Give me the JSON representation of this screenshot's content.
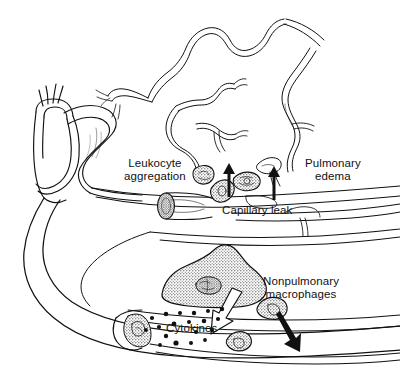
{
  "figure": {
    "background_color": "#ffffff",
    "ink_color": "#111111",
    "stipple_fill": "#c9c9c9",
    "width": 400,
    "height": 376
  },
  "labels": {
    "leukocyte_aggregation": "Leukocyte\naggregation",
    "pulmonary_edema": "Pulmonary\nedema",
    "capillary_leak": "Capillary leak",
    "nonpulmonary_macrophages": "Nonpulmonary\nmacrophages",
    "cytokines": "Cytokines"
  },
  "anatomy": {
    "heart_and_great_vessels": "heart-with-aortic-arch",
    "pulmonary_capillary_network": "tortuous-capillary-bed",
    "alveolar_membrane": "alveolar-septum-lines",
    "cut_vessel_lumen": "cut-vessel-cross-section",
    "systemic_vessel": "large-sweeping-vessel"
  },
  "cells": {
    "leukocytes": "stippled-leukocyte-cells",
    "macrophage_large": "stippled-macrophage-with-nucleus",
    "macrophage_small_a": "stippled-macrophage",
    "macrophage_small_b": "stippled-macrophage",
    "cytokine_particles": "black-dot-cluster"
  },
  "arrows": {
    "leak_arrow_left": "black-up-arrow",
    "leak_arrow_right": "black-up-arrow",
    "cytokine_release_arrow": "white-outlined-down-left-arrow",
    "macrophage_migration_arrow": "black-down-right-arrow"
  }
}
